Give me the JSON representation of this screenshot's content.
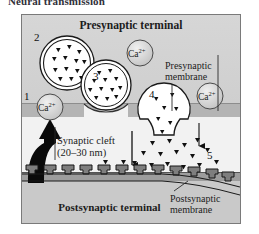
{
  "caption": "Neural transmission",
  "figure": {
    "regions": {
      "presynaptic_terminal": "Presynaptic terminal",
      "postsynaptic_terminal": "Postsynaptic terminal",
      "presynaptic_membrane": "Presynaptic\nmembrane",
      "postsynaptic_membrane": "Postsynaptic\nmembrane",
      "synaptic_cleft": "Synaptic cleft\n(20–30 nm)"
    },
    "labels": {
      "presynaptic_terminal": "Presynaptic terminal",
      "postsynaptic_terminal": "Postsynaptic terminal",
      "presynaptic_membrane_line1": "Presynaptic",
      "presynaptic_membrane_line2": "membrane",
      "postsynaptic_membrane_line1": "Postsynaptic",
      "postsynaptic_membrane_line2": "membrane",
      "synaptic_cleft_line1": "Synaptic cleft",
      "synaptic_cleft_line2": "(20–30 nm)"
    },
    "steps": [
      {
        "id": "1",
        "number": "1",
        "description": "calcium influx at presynaptic membrane"
      },
      {
        "id": "2",
        "number": "2",
        "description": "vesicle filled with neurotransmitter"
      },
      {
        "id": "3",
        "number": "3",
        "description": "vesicle docked at presynaptic membrane"
      },
      {
        "id": "4",
        "number": "4",
        "description": "vesicle fusing and releasing neurotransmitter"
      },
      {
        "id": "5",
        "number": "5",
        "description": "receptors on postsynaptic membrane"
      }
    ],
    "calcium_ions": [
      {
        "id": "ca-1",
        "label": "Ca",
        "charge": "2+",
        "position": "presynaptic membrane left, step 1"
      },
      {
        "id": "ca-2",
        "label": "Ca",
        "charge": "2+",
        "position": "presynaptic terminal centre"
      },
      {
        "id": "ca-3",
        "label": "Ca",
        "charge": "2+",
        "position": "presynaptic terminal right"
      }
    ],
    "colors": {
      "frame_border": "#7a7a7a",
      "presynaptic_cytoplasm": "#d6d6d6",
      "presynaptic_membrane": "#b4b4b4",
      "synaptic_cleft": "#f2f2f2",
      "postsynaptic_membrane": "#9d9d9d",
      "postsynaptic_cytoplasm": "#c9c9c9",
      "vesicle_fill": "#ffffff",
      "neurotransmitter": "#111111",
      "arrow": "#000000",
      "text": "#1c1c1c"
    }
  }
}
